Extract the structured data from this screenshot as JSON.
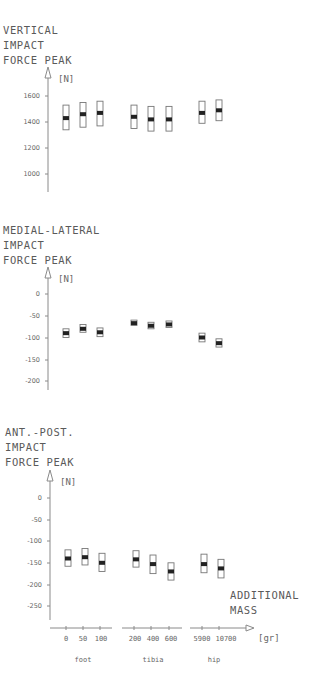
{
  "chart_data": [
    {
      "type": "box-range",
      "title": "VERTICAL IMPACT FORCE PEAK",
      "title_lines": [
        "VERTICAL",
        "IMPACT",
        "FORCE PEAK"
      ],
      "ylabel": "[N]",
      "yticks": [
        1600,
        1400,
        1200,
        1000
      ],
      "ylim": [
        850,
        1700
      ],
      "categories": [
        "0",
        "50",
        "100",
        "200",
        "400",
        "600",
        "5900",
        "10700"
      ],
      "groups": [
        "foot",
        "foot",
        "foot",
        "tibia",
        "tibia",
        "tibia",
        "hip",
        "hip"
      ],
      "mean": [
        1430,
        1460,
        1470,
        1440,
        1420,
        1420,
        1470,
        1490
      ],
      "low": [
        1340,
        1360,
        1370,
        1350,
        1330,
        1330,
        1390,
        1410
      ],
      "high": [
        1530,
        1550,
        1560,
        1530,
        1520,
        1520,
        1560,
        1570
      ]
    },
    {
      "type": "box-range",
      "title": "MEDIAL-LATERAL IMPACT FORCE PEAK",
      "title_lines": [
        "MEDIAL-LATERAL",
        "IMPACT",
        "FORCE PEAK"
      ],
      "ylabel": "[N]",
      "yticks": [
        0,
        -50,
        -100,
        -150,
        -200
      ],
      "ylim": [
        -220,
        20
      ],
      "categories": [
        "0",
        "50",
        "100",
        "200",
        "400",
        "600",
        "5900",
        "10700"
      ],
      "groups": [
        "foot",
        "foot",
        "foot",
        "tibia",
        "tibia",
        "tibia",
        "hip",
        "hip"
      ],
      "mean": [
        -90,
        -80,
        -88,
        -67,
        -73,
        -70,
        -100,
        -113
      ],
      "low": [
        -100,
        -88,
        -98,
        -72,
        -80,
        -77,
        -110,
        -122
      ],
      "high": [
        -80,
        -70,
        -78,
        -60,
        -65,
        -62,
        -90,
        -103
      ]
    },
    {
      "type": "box-range",
      "title": "ANT.-POST. IMPACT FORCE PEAK",
      "title_lines": [
        "ANT.-POST.",
        "IMPACT",
        "FORCE PEAK"
      ],
      "ylabel": "[N]",
      "yticks": [
        0,
        -50,
        -100,
        -150,
        -200,
        -250
      ],
      "ylim": [
        -280,
        20
      ],
      "categories": [
        "0",
        "50",
        "100",
        "200",
        "400",
        "600",
        "5900",
        "10700"
      ],
      "groups": [
        "foot",
        "foot",
        "foot",
        "tibia",
        "tibia",
        "tibia",
        "hip",
        "hip"
      ],
      "mean": [
        -140,
        -137,
        -150,
        -142,
        -153,
        -170,
        -153,
        -163
      ],
      "low": [
        -158,
        -155,
        -170,
        -160,
        -175,
        -190,
        -173,
        -185
      ],
      "high": [
        -120,
        -117,
        -128,
        -122,
        -132,
        -150,
        -130,
        -142
      ],
      "xlabel_lines": [
        "ADDITIONAL",
        "MASS"
      ],
      "xunit": "[gr]",
      "group_labels": [
        "foot",
        "tibia",
        "hip"
      ]
    }
  ],
  "texts": {
    "p1_t1": "VERTICAL",
    "p1_t2": "IMPACT",
    "p1_t3": "FORCE PEAK",
    "p1_unit": "[N]",
    "p1_y0": "1600",
    "p1_y1": "1400",
    "p1_y2": "1200",
    "p1_y3": "1000",
    "p2_t1": "MEDIAL-LATERAL",
    "p2_t2": "IMPACT",
    "p2_t3": "FORCE PEAK",
    "p2_unit": "[N]",
    "p2_y0": "0",
    "p2_y1": "-50",
    "p2_y2": "-100",
    "p2_y3": "-150",
    "p2_y4": "-200",
    "p3_t1": "ANT.-POST.",
    "p3_t2": "IMPACT",
    "p3_t3": "FORCE PEAK",
    "p3_unit": "[N]",
    "p3_y0": "0",
    "p3_y1": "-50",
    "p3_y2": "-100",
    "p3_y3": "-150",
    "p3_y4": "-200",
    "p3_y5": "-250",
    "x0": "0",
    "x1": "50",
    "x2": "100",
    "x3": "200",
    "x4": "400",
    "x5": "600",
    "x6": "5900",
    "x7": "10700",
    "xlabel1": "ADDITIONAL",
    "xlabel2": "MASS",
    "xunit": "[gr]",
    "g_foot": "foot",
    "g_tibia": "tibia",
    "g_hip": "hip"
  }
}
